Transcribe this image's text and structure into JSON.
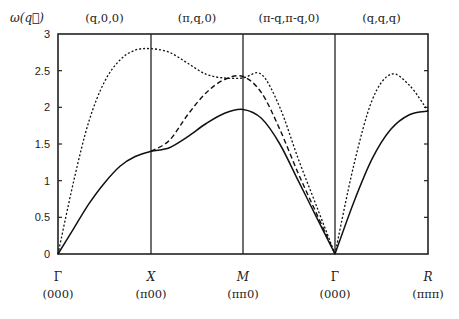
{
  "chart_data": {
    "type": "line",
    "title": "",
    "ylabel": "ω(q⃗)",
    "xlabel": "",
    "ylim": [
      0,
      3
    ],
    "yticks": [
      "0",
      "0.5",
      "1",
      "1.5",
      "2",
      "2.5",
      "3"
    ],
    "ytick_values": [
      0,
      0.5,
      1,
      1.5,
      2,
      2.5,
      3
    ],
    "grid": false,
    "segments": [
      {
        "label": "(q,0,0)",
        "from": 0,
        "to": 1
      },
      {
        "label": "(π,q,0)",
        "from": 1,
        "to": 2
      },
      {
        "label": "(π-q,π-q,0)",
        "from": 2,
        "to": 3
      },
      {
        "label": "(q,q,q)",
        "from": 3,
        "to": 4
      }
    ],
    "high_symmetry_points": [
      {
        "name": "Γ",
        "coord": "(000)",
        "x": 0
      },
      {
        "name": "X",
        "coord": "(π00)",
        "x": 1
      },
      {
        "name": "M",
        "coord": "(ππ0)",
        "x": 2
      },
      {
        "name": "Γ",
        "coord": "(000)",
        "x": 3
      },
      {
        "name": "R",
        "coord": "(πππ)",
        "x": 4
      }
    ],
    "series": [
      {
        "name": "solid",
        "style": "solid",
        "x": [
          0,
          0.17,
          0.33,
          0.5,
          0.67,
          0.83,
          1.0,
          1.2,
          1.4,
          1.6,
          1.8,
          2.0,
          2.2,
          2.4,
          2.6,
          2.8,
          3.0,
          3.2,
          3.4,
          3.6,
          3.8,
          4.0
        ],
        "y": [
          0,
          0.35,
          0.68,
          0.97,
          1.2,
          1.33,
          1.4,
          1.45,
          1.6,
          1.78,
          1.92,
          1.97,
          1.85,
          1.5,
          1.0,
          0.5,
          0,
          0.7,
          1.3,
          1.7,
          1.9,
          1.95
        ]
      },
      {
        "name": "dashed",
        "style": "dashed",
        "x": [
          1.0,
          1.2,
          1.4,
          1.6,
          1.8,
          2.0,
          2.2,
          2.4,
          2.6,
          2.8,
          3.0
        ],
        "y": [
          1.4,
          1.55,
          1.9,
          2.2,
          2.38,
          2.42,
          2.2,
          1.7,
          1.1,
          0.55,
          0
        ]
      },
      {
        "name": "dotted",
        "style": "dotted",
        "x": [
          0,
          0.17,
          0.33,
          0.5,
          0.67,
          0.83,
          1.0,
          1.2,
          1.4,
          1.6,
          1.8,
          2.0,
          2.2,
          2.4,
          2.6,
          2.8,
          3.0,
          3.2,
          3.4,
          3.6,
          3.8,
          4.0
        ],
        "y": [
          0,
          1.0,
          1.8,
          2.35,
          2.65,
          2.78,
          2.8,
          2.75,
          2.6,
          2.45,
          2.4,
          2.4,
          2.45,
          2.0,
          1.3,
          0.65,
          0,
          1.2,
          2.1,
          2.45,
          2.3,
          1.95
        ]
      }
    ]
  }
}
